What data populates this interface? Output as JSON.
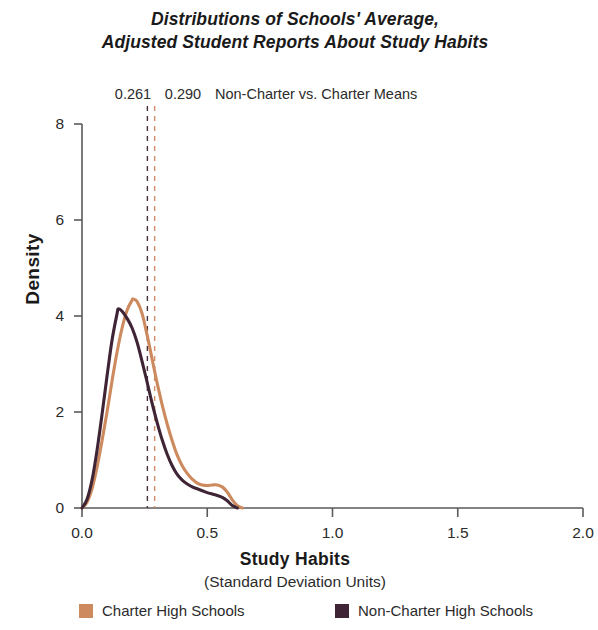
{
  "title": {
    "line1": "Distributions of Schools' Average,",
    "line2": "Adjusted Student Reports About Study Habits"
  },
  "annotation": {
    "value_left": "0.261",
    "value_right": "0.290",
    "text": "Non-Charter vs. Charter Means"
  },
  "axes": {
    "ylabel": "Density",
    "xlabel": "Study Habits",
    "xlabel_sub": "(Standard Deviation Units)",
    "yticks": [
      "0",
      "2",
      "4",
      "6",
      "8"
    ],
    "xticks": [
      "0.0",
      "0.5",
      "1.0",
      "1.5",
      "2.0"
    ]
  },
  "legend": {
    "items": [
      {
        "label": "Charter High Schools",
        "color": "#cd8a5e"
      },
      {
        "label": "Non-Charter High Schools",
        "color": "#3e2435"
      }
    ]
  },
  "colors": {
    "charter": "#cd8a5e",
    "non_charter": "#3e2435",
    "axis": "#5a5a5a",
    "text": "#2b2b2b"
  },
  "chart_data": {
    "type": "line",
    "title": "Distributions of Schools' Average, Adjusted Student Reports About Study Habits",
    "xlabel": "Study Habits (Standard Deviation Units)",
    "ylabel": "Density",
    "xlim": [
      0.0,
      2.0
    ],
    "ylim": [
      0,
      8
    ],
    "xticks": [
      0.0,
      0.5,
      1.0,
      1.5,
      2.0
    ],
    "yticks": [
      0,
      2,
      4,
      6,
      8
    ],
    "grid": false,
    "legend_position": "bottom",
    "annotations": [
      {
        "label": "0.261",
        "value": 0.261,
        "series": "Non-Charter High Schools",
        "style": "dashed-vertical"
      },
      {
        "label": "0.290",
        "value": 0.29,
        "series": "Charter High Schools",
        "style": "dashed-vertical"
      },
      {
        "label": "Non-Charter vs. Charter Means",
        "style": "text"
      }
    ],
    "series": [
      {
        "name": "Charter High Schools",
        "color": "#cd8a5e",
        "x": [
          0.0,
          0.02,
          0.04,
          0.06,
          0.08,
          0.1,
          0.12,
          0.14,
          0.16,
          0.18,
          0.2,
          0.205,
          0.22,
          0.24,
          0.26,
          0.28,
          0.3,
          0.32,
          0.34,
          0.36,
          0.38,
          0.4,
          0.42,
          0.44,
          0.46,
          0.48,
          0.5,
          0.52,
          0.54,
          0.56,
          0.58,
          0.6,
          0.62,
          0.64
        ],
        "y": [
          0.0,
          0.12,
          0.4,
          0.85,
          1.4,
          2.0,
          2.65,
          3.25,
          3.75,
          4.12,
          4.33,
          4.35,
          4.3,
          4.05,
          3.6,
          3.1,
          2.6,
          2.15,
          1.75,
          1.4,
          1.1,
          0.88,
          0.72,
          0.6,
          0.52,
          0.48,
          0.47,
          0.48,
          0.48,
          0.44,
          0.33,
          0.17,
          0.05,
          0.0
        ]
      },
      {
        "name": "Non-Charter High Schools",
        "color": "#3e2435",
        "x": [
          0.0,
          0.02,
          0.04,
          0.06,
          0.08,
          0.1,
          0.12,
          0.14,
          0.145,
          0.16,
          0.18,
          0.2,
          0.22,
          0.24,
          0.26,
          0.28,
          0.3,
          0.32,
          0.34,
          0.36,
          0.38,
          0.4,
          0.42,
          0.44,
          0.46,
          0.48,
          0.5,
          0.52,
          0.54,
          0.56,
          0.58,
          0.6,
          0.62
        ],
        "y": [
          0.0,
          0.18,
          0.58,
          1.2,
          1.95,
          2.75,
          3.5,
          4.05,
          4.15,
          4.1,
          3.95,
          3.75,
          3.45,
          3.05,
          2.62,
          2.18,
          1.78,
          1.42,
          1.12,
          0.88,
          0.7,
          0.58,
          0.5,
          0.44,
          0.4,
          0.36,
          0.32,
          0.29,
          0.26,
          0.22,
          0.15,
          0.05,
          0.0
        ]
      }
    ]
  }
}
